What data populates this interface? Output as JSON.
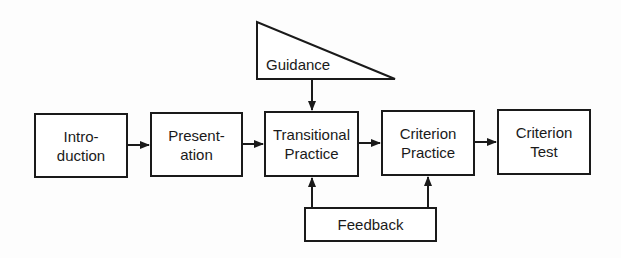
{
  "diagram": {
    "boxes": [
      {
        "id": "introduction",
        "label": "Intro-\nduction"
      },
      {
        "id": "presentation",
        "label": "Presentation-\nation"
      },
      {
        "id": "transitional-practice",
        "label": "Transitional\nPractice"
      },
      {
        "id": "criterion-practice",
        "label": "Criterion\nPractice"
      },
      {
        "id": "criterion-test",
        "label": "Criterion\nTest"
      }
    ],
    "guidance": {
      "label": "Guidance"
    },
    "feedback": {
      "label": "Feedback"
    },
    "colors": {
      "stroke": "#1a1a1a",
      "background": "#fdfdfd"
    }
  }
}
